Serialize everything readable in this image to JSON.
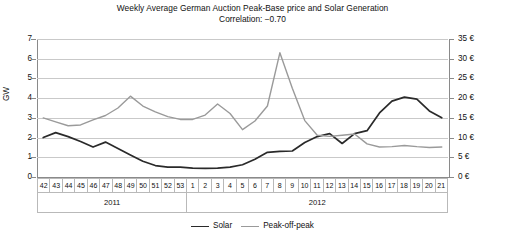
{
  "chart_data": {
    "type": "line",
    "title": "Weekly Average German Auction Peak-Base price and Solar Generation",
    "subtitle": "Correlation: −0.70",
    "xlabel": "",
    "ylabel": "GW",
    "y2label": "",
    "ylim": [
      0,
      7
    ],
    "y2lim": [
      0,
      35
    ],
    "yticks": [
      "0",
      "1",
      "2",
      "3",
      "4",
      "5",
      "6",
      "7"
    ],
    "y2ticks": [
      "0 €",
      "5 €",
      "10 €",
      "15 €",
      "20 €",
      "25 €",
      "30 €",
      "35 €"
    ],
    "grid": true,
    "legend_position": "bottom",
    "categories": [
      "42",
      "43",
      "44",
      "45",
      "46",
      "47",
      "48",
      "49",
      "50",
      "51",
      "52",
      "53",
      "1",
      "2",
      "3",
      "4",
      "5",
      "6",
      "7",
      "8",
      "9",
      "10",
      "11",
      "12",
      "13",
      "14",
      "15",
      "16",
      "17",
      "18",
      "19",
      "20",
      "21"
    ],
    "groups": [
      {
        "label": "2011",
        "span": 12
      },
      {
        "label": "2012",
        "span": 21
      }
    ],
    "series": [
      {
        "name": "Solar",
        "axis": "left",
        "unit": "GW",
        "color": "#2a2a2a",
        "values": [
          2.0,
          2.25,
          2.05,
          1.8,
          1.52,
          1.77,
          1.45,
          1.12,
          0.8,
          0.58,
          0.5,
          0.5,
          0.45,
          0.44,
          0.45,
          0.5,
          0.62,
          0.9,
          1.25,
          1.3,
          1.32,
          1.75,
          2.05,
          2.2,
          1.7,
          2.2,
          2.35,
          3.25,
          3.85,
          4.05,
          3.95,
          3.35,
          3.0
        ]
      },
      {
        "name": "Peak-off-peak",
        "axis": "right",
        "unit": "€",
        "color": "#9a9a9a",
        "values": [
          15.0,
          14.0,
          13.0,
          13.2,
          14.5,
          15.6,
          17.5,
          20.5,
          18.0,
          16.5,
          15.3,
          14.6,
          14.6,
          15.7,
          18.5,
          16.1,
          12.0,
          14.2,
          18.0,
          31.5,
          22.5,
          14.3,
          10.6,
          10.3,
          10.6,
          10.9,
          8.4,
          7.6,
          7.7,
          8.0,
          7.7,
          7.5,
          7.6
        ]
      }
    ],
    "series_detailed_right_axis_in_left_units": {
      "note_hidden": false
    }
  },
  "legend": {
    "items": [
      {
        "label": "Solar",
        "color": "#2a2a2a"
      },
      {
        "label": "Peak-off-peak",
        "color": "#9a9a9a"
      }
    ]
  }
}
